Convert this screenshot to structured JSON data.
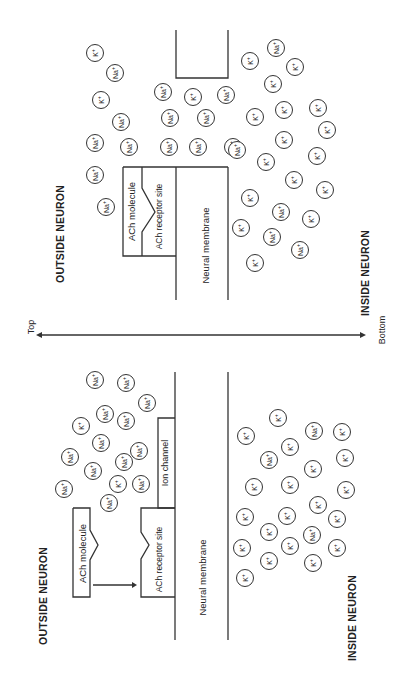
{
  "axis": {
    "top_label": "Top",
    "bottom_label": "Bottom"
  },
  "panels": [
    {
      "id": "bound",
      "outside_label": "OUTSIDE NEURON",
      "inside_label": "INSIDE NEURON",
      "ach_label": "ACh molecule",
      "receptor_label": "ACh receptor site",
      "membrane_label": "Neural membrane",
      "ions": [
        {
          "ion": "K",
          "charge": "+",
          "x": 95,
          "y": 53
        },
        {
          "ion": "Na",
          "charge": "+",
          "x": 115,
          "y": 73
        },
        {
          "ion": "K",
          "charge": "+",
          "x": 101,
          "y": 100
        },
        {
          "ion": "Na",
          "charge": "+",
          "x": 121,
          "y": 122
        },
        {
          "ion": "Na",
          "charge": "+",
          "x": 95,
          "y": 143
        },
        {
          "ion": "Na",
          "charge": "+",
          "x": 129,
          "y": 147
        },
        {
          "ion": "Na",
          "charge": "+",
          "x": 95,
          "y": 175
        },
        {
          "ion": "Na",
          "charge": "+",
          "x": 106,
          "y": 207
        },
        {
          "ion": "Na",
          "charge": "+",
          "x": 163,
          "y": 92
        },
        {
          "ion": "K",
          "charge": "+",
          "x": 193,
          "y": 97
        },
        {
          "ion": "Na",
          "charge": "+",
          "x": 226,
          "y": 95
        },
        {
          "ion": "Na",
          "charge": "+",
          "x": 170,
          "y": 118
        },
        {
          "ion": "Na",
          "charge": "+",
          "x": 206,
          "y": 118
        },
        {
          "ion": "Na",
          "charge": "+",
          "x": 169,
          "y": 147
        },
        {
          "ion": "Na",
          "charge": "+",
          "x": 198,
          "y": 147
        },
        {
          "ion": "Na",
          "charge": "+",
          "x": 233,
          "y": 147
        },
        {
          "ion": "Na",
          "charge": "+",
          "x": 237,
          "y": 150
        },
        {
          "ion": "Na",
          "charge": "+",
          "x": 276,
          "y": 48
        },
        {
          "ion": "K",
          "charge": "+",
          "x": 250,
          "y": 61
        },
        {
          "ion": "K",
          "charge": "+",
          "x": 295,
          "y": 67
        },
        {
          "ion": "K",
          "charge": "+",
          "x": 273,
          "y": 84
        },
        {
          "ion": "K",
          "charge": "+",
          "x": 318,
          "y": 108
        },
        {
          "ion": "K",
          "charge": "+",
          "x": 284,
          "y": 110
        },
        {
          "ion": "K",
          "charge": "+",
          "x": 255,
          "y": 117
        },
        {
          "ion": "K",
          "charge": "+",
          "x": 327,
          "y": 130
        },
        {
          "ion": "K",
          "charge": "+",
          "x": 284,
          "y": 140
        },
        {
          "ion": "K",
          "charge": "+",
          "x": 317,
          "y": 156
        },
        {
          "ion": "K",
          "charge": "+",
          "x": 266,
          "y": 162
        },
        {
          "ion": "K",
          "charge": "+",
          "x": 294,
          "y": 180
        },
        {
          "ion": "K",
          "charge": "+",
          "x": 325,
          "y": 190
        },
        {
          "ion": "K",
          "charge": "+",
          "x": 250,
          "y": 198
        },
        {
          "ion": "Na",
          "charge": "+",
          "x": 281,
          "y": 212
        },
        {
          "ion": "K",
          "charge": "+",
          "x": 311,
          "y": 219
        },
        {
          "ion": "K",
          "charge": "+",
          "x": 241,
          "y": 228
        },
        {
          "ion": "Na",
          "charge": "+",
          "x": 272,
          "y": 237
        },
        {
          "ion": "Na",
          "charge": "+",
          "x": 300,
          "y": 250
        },
        {
          "ion": "K",
          "charge": "+",
          "x": 255,
          "y": 263
        }
      ]
    },
    {
      "id": "unbound",
      "outside_label": "OUTSIDE NEURON",
      "inside_label": "INSIDE NEURON",
      "ach_label": "ACh molecule",
      "receptor_label": "ACh receptor site",
      "channel_label": "Ion channel",
      "membrane_label": "Neural membrane",
      "ions": [
        {
          "ion": "Na",
          "charge": "+",
          "x": 95,
          "y": 380
        },
        {
          "ion": "Na",
          "charge": "+",
          "x": 126,
          "y": 383
        },
        {
          "ion": "Na",
          "charge": "+",
          "x": 147,
          "y": 403
        },
        {
          "ion": "Na",
          "charge": "+",
          "x": 105,
          "y": 414
        },
        {
          "ion": "K",
          "charge": "+",
          "x": 81,
          "y": 426
        },
        {
          "ion": "Na",
          "charge": "+",
          "x": 126,
          "y": 421
        },
        {
          "ion": "Na",
          "charge": "+",
          "x": 101,
          "y": 443
        },
        {
          "ion": "Na",
          "charge": "+",
          "x": 139,
          "y": 451
        },
        {
          "ion": "Na",
          "charge": "+",
          "x": 70,
          "y": 457
        },
        {
          "ion": "Na",
          "charge": "+",
          "x": 124,
          "y": 462
        },
        {
          "ion": "Na",
          "charge": "+",
          "x": 93,
          "y": 471
        },
        {
          "ion": "K",
          "charge": "+",
          "x": 118,
          "y": 484
        },
        {
          "ion": "Na",
          "charge": "+",
          "x": 141,
          "y": 484
        },
        {
          "ion": "Na",
          "charge": "+",
          "x": 64,
          "y": 489
        },
        {
          "ion": "Na",
          "charge": "+",
          "x": 109,
          "y": 503
        },
        {
          "ion": "K",
          "charge": "+",
          "x": 278,
          "y": 418
        },
        {
          "ion": "K",
          "charge": "+",
          "x": 246,
          "y": 436
        },
        {
          "ion": "Na",
          "charge": "+",
          "x": 314,
          "y": 431
        },
        {
          "ion": "K",
          "charge": "+",
          "x": 342,
          "y": 432
        },
        {
          "ion": "Na",
          "charge": "+",
          "x": 269,
          "y": 460
        },
        {
          "ion": "K",
          "charge": "+",
          "x": 290,
          "y": 447
        },
        {
          "ion": "K",
          "charge": "+",
          "x": 313,
          "y": 469
        },
        {
          "ion": "K",
          "charge": "+",
          "x": 345,
          "y": 458
        },
        {
          "ion": "K",
          "charge": "+",
          "x": 254,
          "y": 487
        },
        {
          "ion": "K",
          "charge": "+",
          "x": 290,
          "y": 485
        },
        {
          "ion": "K",
          "charge": "+",
          "x": 346,
          "y": 490
        },
        {
          "ion": "K",
          "charge": "+",
          "x": 318,
          "y": 505
        },
        {
          "ion": "K",
          "charge": "+",
          "x": 245,
          "y": 517
        },
        {
          "ion": "K",
          "charge": "+",
          "x": 287,
          "y": 516
        },
        {
          "ion": "K",
          "charge": "+",
          "x": 337,
          "y": 519
        },
        {
          "ion": "K",
          "charge": "+",
          "x": 269,
          "y": 532
        },
        {
          "ion": "Na",
          "charge": "+",
          "x": 312,
          "y": 535
        },
        {
          "ion": "K",
          "charge": "+",
          "x": 290,
          "y": 546
        },
        {
          "ion": "K",
          "charge": "+",
          "x": 242,
          "y": 548
        },
        {
          "ion": "K",
          "charge": "+",
          "x": 269,
          "y": 561
        },
        {
          "ion": "K",
          "charge": "+",
          "x": 313,
          "y": 563
        },
        {
          "ion": "K",
          "charge": "+",
          "x": 337,
          "y": 548
        },
        {
          "ion": "K",
          "charge": "+",
          "x": 245,
          "y": 578
        }
      ]
    }
  ]
}
